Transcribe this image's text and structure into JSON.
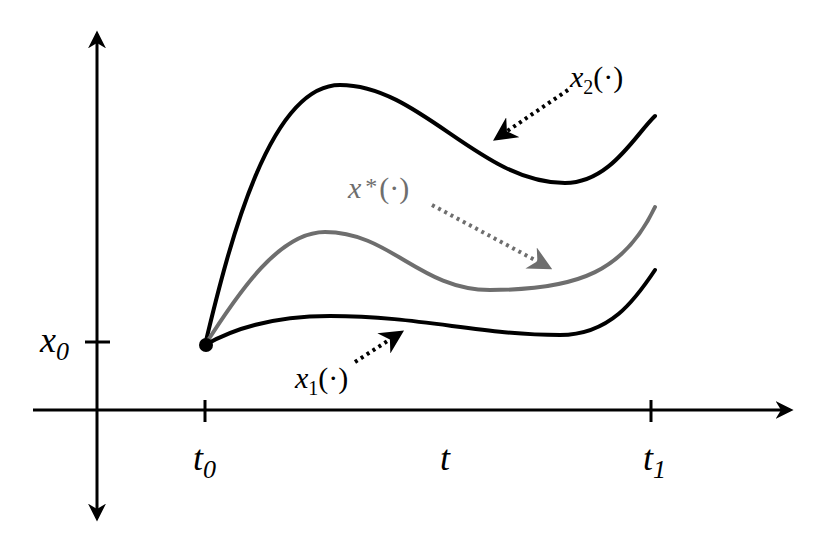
{
  "diagram": {
    "type": "trajectory-comparison",
    "axes": {
      "horizontal_label": "t",
      "vertical_label_tick": "x0",
      "ticks": {
        "t0": {
          "base": "t",
          "sub": "0"
        },
        "t1": {
          "base": "t",
          "sub": "1"
        },
        "x0": {
          "base": "x",
          "sub": "0"
        }
      }
    },
    "initial_point": {
      "label": "(t0, x0)"
    },
    "curves": [
      {
        "id": "x2",
        "base": "x",
        "sub": "2",
        "suffix": "(·)",
        "color": "#000000",
        "role": "upper admissible trajectory"
      },
      {
        "id": "xstar",
        "base": "x",
        "sup": "*",
        "suffix": "(·)",
        "color": "#6e6e6e",
        "role": "optimal trajectory"
      },
      {
        "id": "x1",
        "base": "x",
        "sub": "1",
        "suffix": "(·)",
        "color": "#000000",
        "role": "lower admissible trajectory"
      }
    ],
    "colors": {
      "axis": "#000000",
      "optimal": "#6e6e6e",
      "background": "#ffffff"
    }
  }
}
